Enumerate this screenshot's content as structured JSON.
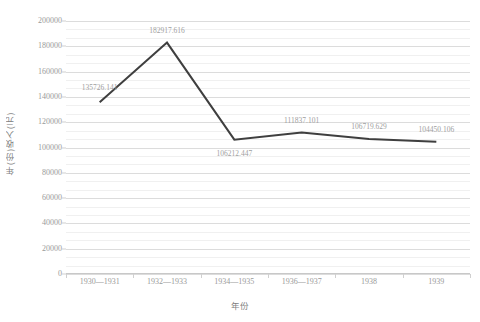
{
  "chart_data": {
    "type": "line",
    "title": "",
    "xlabel": "年份",
    "ylabel": "年(份)收入(元)",
    "categories": [
      "1930—1931",
      "1932—1933",
      "1934—1935",
      "1936—1937",
      "1938",
      "1939"
    ],
    "values": [
      135726.141,
      182917.616,
      106212.447,
      111837.101,
      106719.629,
      104450.106
    ],
    "data_labels": [
      "135726.141",
      "182917.616",
      "106212.447",
      "111837.101",
      "106719.629",
      "104450.106"
    ],
    "ylim": [
      0,
      200000
    ],
    "ytick_step": 20000,
    "ytick_labels": [
      "0",
      "20000",
      "40000",
      "60000",
      "80000",
      "100000",
      "120000",
      "140000",
      "160000",
      "180000",
      "200000"
    ],
    "ytick_values": [
      0,
      20000,
      40000,
      60000,
      80000,
      100000,
      120000,
      140000,
      160000,
      180000,
      200000
    ],
    "minor_gridlines_per_major": 2,
    "grid": true,
    "legend": false,
    "legend_position": "none",
    "series": [
      {
        "name": "年(份)收入(元)",
        "color": "#3f3f3f",
        "line_width": 2,
        "values": [
          135726.141,
          182917.616,
          106212.447,
          111837.101,
          106719.629,
          104450.106
        ]
      }
    ],
    "colors": {
      "line": "#3f3f3f",
      "gridline_major": "#dcdcdc",
      "gridline_minor": "#f0f0f0",
      "tick_label": "#9a9a9a",
      "axis_title": "#7f7f7f",
      "data_label": "#a0a0a0",
      "background": "#ffffff"
    }
  }
}
